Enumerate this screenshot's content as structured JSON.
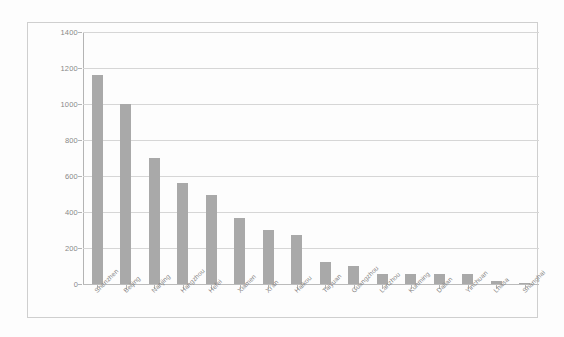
{
  "chart_data": {
    "type": "bar",
    "title": "",
    "subtitle": "",
    "xlabel": "",
    "ylabel": "",
    "ylim": [
      0,
      1400
    ],
    "ytick_step": 200,
    "yticks": [
      0,
      200,
      400,
      600,
      800,
      1000,
      1200,
      1400
    ],
    "grid": true,
    "legend": false,
    "legend_position": "none",
    "bar_color": "#7e7e7e",
    "gridline_color": "#c4c4c4",
    "axis_color": "#8f8f8f",
    "frame_color": "#b9b9b9",
    "background": "#ffffff",
    "categories": [
      "Shenzhen",
      "Beijing",
      "Nanjing",
      "Hangzhou",
      "Hefei",
      "Xiamen",
      "Xi'an",
      "Haikou",
      "Taiyuan",
      "Guangzhou",
      "Lanzhou",
      "Kunming",
      "Dalian",
      "Yinchuan",
      "Lhasa",
      "Shanghai"
    ],
    "values": [
      1160,
      1000,
      700,
      560,
      495,
      365,
      300,
      275,
      125,
      100,
      55,
      55,
      55,
      55,
      15,
      3
    ]
  }
}
